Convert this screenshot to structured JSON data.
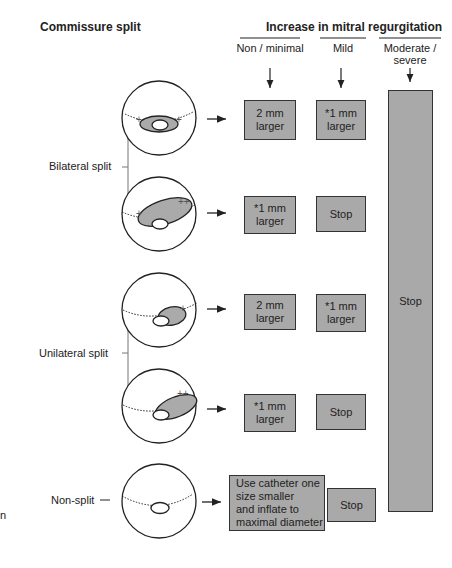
{
  "title_left": "Commissure split",
  "title_right": "Increase in mitral regurgitation",
  "columns": [
    {
      "label": "Non / minimal"
    },
    {
      "label": "Mild"
    },
    {
      "label": "Moderate /\nsevere"
    }
  ],
  "groups": [
    {
      "label": "Bilateral split"
    },
    {
      "label": "Unilateral split"
    },
    {
      "label": "Non-split"
    }
  ],
  "rows": [
    {
      "nonminimal": "2 mm\nlarger",
      "mild": "*1 mm\nlarger",
      "markers": [
        "+",
        "+"
      ]
    },
    {
      "nonminimal": "*1 mm\nlarger",
      "mild": "Stop",
      "markers": [
        "+",
        "++"
      ]
    },
    {
      "nonminimal": "2 mm\nlarger",
      "mild": "*1 mm\nlarger",
      "markers": [
        "+"
      ]
    },
    {
      "nonminimal": "*1 mm\nlarger",
      "mild": "Stop",
      "markers": [
        "++"
      ]
    },
    {
      "nonminimal": "Use catheter one\nsize smaller\nand inflate to\nmaximal diameter",
      "mild": "Stop",
      "markers": []
    }
  ],
  "severe_box": "Stop",
  "stray_text": "n",
  "colors": {
    "box_fill": "#a9a9a9",
    "line": "#222222"
  }
}
